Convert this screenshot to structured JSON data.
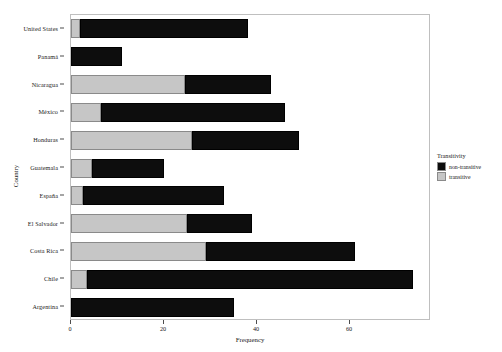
{
  "chart_data": {
    "type": "bar",
    "orientation": "horizontal",
    "stacked": true,
    "title": "",
    "xlabel": "Frequency",
    "ylabel": "Country",
    "xlim": [
      0,
      77.4
    ],
    "xticks": [
      0,
      20,
      40,
      60
    ],
    "xticklabels": [
      "0",
      "20",
      "40",
      "60"
    ],
    "grid": false,
    "categories": [
      "United States",
      "Panamá",
      "Nicaragua",
      "México",
      "Honduras",
      "Guatemala",
      "España",
      "El Salvador",
      "Costa Rica",
      "Chile",
      "Argentina"
    ],
    "series": [
      {
        "name": "transitive",
        "color": "#c6c6c6",
        "values": [
          2,
          0,
          24.5,
          6.5,
          26,
          4.5,
          2.5,
          25,
          29,
          3.5,
          0
        ]
      },
      {
        "name": "non-transitive",
        "color": "#0d0d0d",
        "values": [
          36,
          11,
          18.5,
          39.5,
          23,
          15.5,
          30.5,
          14,
          32,
          70,
          35
        ]
      }
    ],
    "totals": [
      38,
      11,
      43,
      46,
      49,
      20,
      33,
      39,
      61,
      73.5,
      35
    ],
    "legend": {
      "title": "Transitivity",
      "position": "right",
      "entries": [
        {
          "label": "non-transitive",
          "color": "#0d0d0d"
        },
        {
          "label": "transitive",
          "color": "#c6c6c6"
        }
      ]
    }
  }
}
